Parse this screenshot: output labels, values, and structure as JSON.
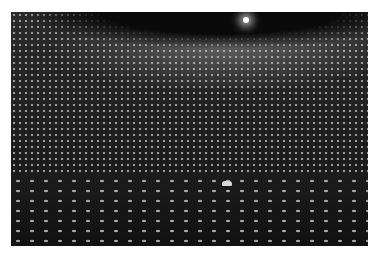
{
  "image": {
    "description": "Interior of a large cylindrical detector tank lined with a dense grid of photomultiplier tubes, with a small boat on the water surface",
    "alt": "Photomultiplier tube array inside detector tank",
    "colors": {
      "background": "#ffffff",
      "photo_dark": "#151515",
      "tube_highlight": "#9a9a9a",
      "ceiling_light": "#ffffff"
    }
  }
}
